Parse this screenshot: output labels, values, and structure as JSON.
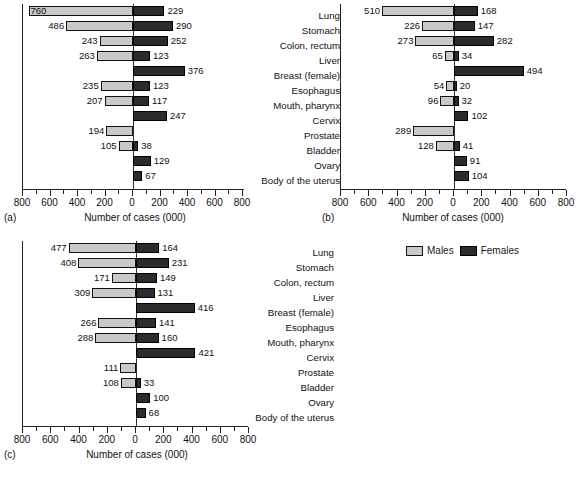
{
  "figure": {
    "categories": [
      "Lung",
      "Stomach",
      "Colon, rectum",
      "Liver",
      "Breast (female)",
      "Esophagus",
      "Mouth, pharynx",
      "Cervix",
      "Prostate",
      "Bladder",
      "Ovary",
      "Body of the uterus"
    ],
    "axis_title": "Number of cases (000)",
    "tick_labels": [
      "800",
      "600",
      "400",
      "200",
      "0",
      "200",
      "400",
      "600",
      "800"
    ],
    "panel_keys": {
      "a": "(a)",
      "b": "(b)",
      "c": "(c)"
    }
  },
  "legend": {
    "position": "right-of-panel-c",
    "entries": [
      {
        "label": "Males",
        "color": "#c9c9c9"
      },
      {
        "label": "Females",
        "color": "#2b2b2b"
      }
    ]
  },
  "colors": {
    "males": "#c9c9c9",
    "females": "#2b2b2b",
    "axis": "#202020",
    "text": "#111111"
  },
  "chart_data": [
    {
      "type": "bar",
      "panel": "(a)",
      "orientation": "horizontal",
      "layout": "back-to-back (diverging) population pyramid",
      "title": "",
      "xlabel": "Number of cases (000)",
      "ylabel": "",
      "xlim": [
        -800,
        800
      ],
      "xticks": [
        -800,
        -600,
        -400,
        -200,
        0,
        200,
        400,
        600,
        800
      ],
      "xticklabels": [
        "800",
        "600",
        "400",
        "200",
        "0",
        "200",
        "400",
        "600",
        "800"
      ],
      "minor_tick_interval": 100,
      "grid": false,
      "legend": [
        "Males",
        "Females"
      ],
      "categories": [
        "Lung",
        "Stomach",
        "Colon, rectum",
        "Liver",
        "Breast (female)",
        "Esophagus",
        "Mouth, pharynx",
        "Cervix",
        "Prostate",
        "Bladder",
        "Ovary",
        "Body of the uterus"
      ],
      "series": [
        {
          "name": "Males",
          "direction": "left",
          "values": [
            760,
            486,
            243,
            263,
            null,
            235,
            207,
            null,
            194,
            105,
            null,
            null
          ]
        },
        {
          "name": "Females",
          "direction": "right",
          "values": [
            229,
            290,
            252,
            123,
            376,
            123,
            117,
            247,
            null,
            38,
            129,
            67
          ]
        }
      ]
    },
    {
      "type": "bar",
      "panel": "(b)",
      "orientation": "horizontal",
      "layout": "back-to-back (diverging) population pyramid",
      "title": "",
      "xlabel": "Number of cases (000)",
      "ylabel": "",
      "xlim": [
        -800,
        800
      ],
      "xticks": [
        -800,
        -600,
        -400,
        -200,
        0,
        200,
        400,
        600,
        800
      ],
      "xticklabels": [
        "800",
        "600",
        "400",
        "200",
        "0",
        "200",
        "400",
        "600",
        "800"
      ],
      "minor_tick_interval": 100,
      "grid": false,
      "legend": [
        "Males",
        "Females"
      ],
      "categories": [
        "Lung",
        "Stomach",
        "Colon, rectum",
        "Liver",
        "Breast (female)",
        "Esophagus",
        "Mouth, pharynx",
        "Cervix",
        "Prostate",
        "Bladder",
        "Ovary",
        "Body of the uterus"
      ],
      "series": [
        {
          "name": "Males",
          "direction": "left",
          "values": [
            510,
            226,
            273,
            65,
            null,
            54,
            96,
            null,
            289,
            128,
            null,
            null
          ]
        },
        {
          "name": "Females",
          "direction": "right",
          "values": [
            168,
            147,
            282,
            34,
            494,
            20,
            32,
            102,
            null,
            41,
            91,
            104
          ]
        }
      ]
    },
    {
      "type": "bar",
      "panel": "(c)",
      "orientation": "horizontal",
      "layout": "back-to-back (diverging) population pyramid",
      "title": "",
      "xlabel": "Number of cases (000)",
      "ylabel": "",
      "xlim": [
        -800,
        800
      ],
      "xticks": [
        -800,
        -600,
        -400,
        -200,
        0,
        200,
        400,
        600,
        800
      ],
      "xticklabels": [
        "800",
        "600",
        "400",
        "200",
        "0",
        "200",
        "400",
        "600",
        "800"
      ],
      "minor_tick_interval": 100,
      "grid": false,
      "legend": [
        "Males",
        "Females"
      ],
      "categories": [
        "Lung",
        "Stomach",
        "Colon, rectum",
        "Liver",
        "Breast (female)",
        "Esophagus",
        "Mouth, pharynx",
        "Cervix",
        "Prostate",
        "Bladder",
        "Ovary",
        "Body of the uterus"
      ],
      "series": [
        {
          "name": "Males",
          "direction": "left",
          "values": [
            477,
            408,
            171,
            309,
            null,
            266,
            288,
            null,
            111,
            108,
            null,
            null
          ]
        },
        {
          "name": "Females",
          "direction": "right",
          "values": [
            164,
            231,
            149,
            131,
            416,
            141,
            160,
            421,
            null,
            33,
            100,
            68
          ]
        }
      ]
    }
  ]
}
